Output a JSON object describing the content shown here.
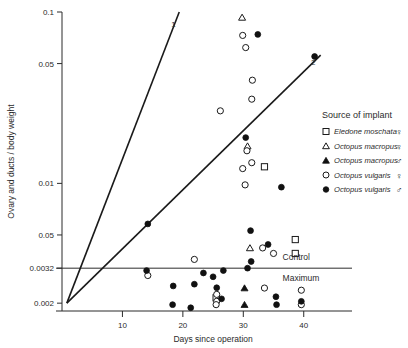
{
  "chart_data": {
    "type": "scatter",
    "title": "",
    "xlabel": "Days since operation",
    "ylabel": "Ovary and ducts / body weight",
    "xlim": [
      0,
      46
    ],
    "ylim_log": [
      0.0018,
      0.1
    ],
    "yscale": "log",
    "grid": false,
    "xticks": [
      10,
      20,
      30,
      40
    ],
    "xticklabels": [
      "10",
      "20",
      "30",
      "40"
    ],
    "yticks": [
      0.1,
      0.05,
      0.01,
      0.005,
      0.0032,
      0.002
    ],
    "yticklabels": [
      "0.1",
      "0.05",
      "0.01",
      "0.05",
      "0.0032",
      "0.002"
    ],
    "annotations": [
      {
        "name": "control",
        "text": "Control",
        "x": 36.5,
        "y": 0.0037
      },
      {
        "name": "maximum",
        "text": "Maximum",
        "x": 36.5,
        "y": 0.0028
      }
    ],
    "reference_lines": [
      {
        "name": "control-maximum-line",
        "type": "horizontal",
        "y": 0.0032
      }
    ],
    "trend_lines": [
      {
        "label": "1",
        "x0": 0.8,
        "y0": 0.002,
        "x1": 19.4,
        "y1": 0.1
      },
      {
        "label": "2",
        "x0": 0.8,
        "y0": 0.002,
        "x1": 42.8,
        "y1": 0.056
      }
    ],
    "legend_title": "Source of implant",
    "legend_position": "right",
    "series": [
      {
        "name": "Eledone moschata female",
        "species": "Eledone moschata",
        "sex": "♀",
        "marker": "open-square",
        "points": [
          {
            "x": 33.5,
            "y": 0.0125
          },
          {
            "x": 38.6,
            "y": 0.0047
          },
          {
            "x": 38.6,
            "y": 0.0039
          },
          {
            "x": 25.5,
            "y": 0.00215
          }
        ]
      },
      {
        "name": "Octopus macropus female",
        "species": "Octopus macropus",
        "sex": "♀",
        "marker": "open-triangle",
        "points": [
          {
            "x": 29.8,
            "y": 0.093
          },
          {
            "x": 30.7,
            "y": 0.0165
          },
          {
            "x": 31.1,
            "y": 0.0042
          }
        ]
      },
      {
        "name": "Octopus macropus male",
        "species": "Octopus macropus",
        "sex": "♂",
        "marker": "filled-triangle",
        "points": [
          {
            "x": 30.2,
            "y": 0.00245
          },
          {
            "x": 30.2,
            "y": 0.00196
          }
        ]
      },
      {
        "name": "Octopus vulgaris female",
        "species": "Octopus vulgaris",
        "sex": "♀",
        "marker": "open-circle",
        "points": [
          {
            "x": 29.9,
            "y": 0.073
          },
          {
            "x": 30.4,
            "y": 0.062
          },
          {
            "x": 31.5,
            "y": 0.04
          },
          {
            "x": 31.4,
            "y": 0.031
          },
          {
            "x": 26.2,
            "y": 0.0265
          },
          {
            "x": 30.6,
            "y": 0.0155
          },
          {
            "x": 31.4,
            "y": 0.0132
          },
          {
            "x": 29.9,
            "y": 0.0122
          },
          {
            "x": 30.3,
            "y": 0.0098
          },
          {
            "x": 33.2,
            "y": 0.0042
          },
          {
            "x": 35.0,
            "y": 0.0039
          },
          {
            "x": 21.9,
            "y": 0.0036
          },
          {
            "x": 14.2,
            "y": 0.0029
          },
          {
            "x": 25.6,
            "y": 0.00225
          },
          {
            "x": 25.6,
            "y": 0.00205
          },
          {
            "x": 33.5,
            "y": 0.00245
          },
          {
            "x": 39.6,
            "y": 0.00238
          },
          {
            "x": 39.6,
            "y": 0.00196
          },
          {
            "x": 25.5,
            "y": 0.00196
          }
        ]
      },
      {
        "name": "Octopus vulgaris male",
        "species": "Octopus vulgaris",
        "sex": "♂",
        "marker": "filled-circle",
        "points": [
          {
            "x": 32.4,
            "y": 0.074
          },
          {
            "x": 41.8,
            "y": 0.055
          },
          {
            "x": 30.4,
            "y": 0.0185
          },
          {
            "x": 36.3,
            "y": 0.0095
          },
          {
            "x": 14.2,
            "y": 0.0058
          },
          {
            "x": 31.2,
            "y": 0.0053
          },
          {
            "x": 34.1,
            "y": 0.0044
          },
          {
            "x": 14.0,
            "y": 0.0031
          },
          {
            "x": 23.4,
            "y": 0.003
          },
          {
            "x": 25.0,
            "y": 0.00285
          },
          {
            "x": 26.7,
            "y": 0.0031
          },
          {
            "x": 30.7,
            "y": 0.0032
          },
          {
            "x": 31.3,
            "y": 0.0035
          },
          {
            "x": 18.4,
            "y": 0.00252
          },
          {
            "x": 21.9,
            "y": 0.00258
          },
          {
            "x": 25.6,
            "y": 0.00246
          },
          {
            "x": 26.4,
            "y": 0.00212
          },
          {
            "x": 35.4,
            "y": 0.00218
          },
          {
            "x": 39.6,
            "y": 0.00205
          },
          {
            "x": 18.3,
            "y": 0.00196
          },
          {
            "x": 35.5,
            "y": 0.00196
          },
          {
            "x": 21.3,
            "y": 0.00188
          }
        ]
      }
    ]
  },
  "legend": {
    "title": "Source of implant",
    "items": [
      {
        "marker": "open-square",
        "label": "Eledone moschata",
        "sex": "♀"
      },
      {
        "marker": "open-triangle",
        "label": "Octopus macropus",
        "sex": "♀"
      },
      {
        "marker": "filled-triangle",
        "label": "Octopus macropus",
        "sex": "♂"
      },
      {
        "marker": "open-circle",
        "label": "Octopus vulgaris",
        "sex": "♀"
      },
      {
        "marker": "filled-circle",
        "label": "Octopus vulgaris",
        "sex": "♂"
      }
    ]
  },
  "colors": {
    "axis": "#2b2b2b",
    "marker": "#111111",
    "background": "#ffffff"
  }
}
